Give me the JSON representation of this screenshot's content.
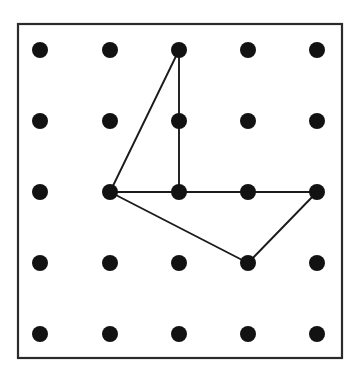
{
  "figure": {
    "background_color": "#ffffff",
    "frame": {
      "x": 18,
      "y": 24,
      "width": 324,
      "height": 334,
      "stroke_color": "#2b2b2b",
      "stroke_width": 2.2,
      "fill_color": "#ffffff"
    },
    "grid": {
      "rows": 5,
      "columns": 5,
      "column_x": [
        40,
        110,
        179,
        248,
        317
      ],
      "row_y": [
        50,
        121,
        192,
        263,
        334
      ],
      "peg_radius": 8,
      "peg_color": "#121212"
    },
    "band": {
      "stroke_color": "#1b1b1b",
      "stroke_width": 1.9,
      "edges": [
        {
          "from": [
            2,
            0
          ],
          "to": [
            1,
            2
          ]
        },
        {
          "from": [
            2,
            0
          ],
          "to": [
            2,
            2
          ]
        },
        {
          "from": [
            1,
            2
          ],
          "to": [
            2,
            2
          ]
        },
        {
          "from": [
            2,
            2
          ],
          "to": [
            3,
            2
          ]
        },
        {
          "from": [
            3,
            2
          ],
          "to": [
            4,
            2
          ]
        },
        {
          "from": [
            1,
            2
          ],
          "to": [
            3,
            3
          ]
        },
        {
          "from": [
            3,
            3
          ],
          "to": [
            4,
            2
          ]
        }
      ],
      "vertices": [
        {
          "col": 2,
          "row": 0,
          "label": "top-apex"
        },
        {
          "col": 1,
          "row": 2,
          "label": "left-hub"
        },
        {
          "col": 2,
          "row": 2,
          "label": "center"
        },
        {
          "col": 3,
          "row": 2,
          "label": "mid-right"
        },
        {
          "col": 4,
          "row": 2,
          "label": "right-corner"
        },
        {
          "col": 3,
          "row": 3,
          "label": "bottom-apex"
        }
      ]
    },
    "pegs": [
      {
        "col": 0,
        "row": 0
      },
      {
        "col": 1,
        "row": 0
      },
      {
        "col": 2,
        "row": 0
      },
      {
        "col": 3,
        "row": 0
      },
      {
        "col": 4,
        "row": 0
      },
      {
        "col": 0,
        "row": 1
      },
      {
        "col": 1,
        "row": 1
      },
      {
        "col": 2,
        "row": 1
      },
      {
        "col": 3,
        "row": 1
      },
      {
        "col": 4,
        "row": 1
      },
      {
        "col": 0,
        "row": 2
      },
      {
        "col": 1,
        "row": 2
      },
      {
        "col": 2,
        "row": 2
      },
      {
        "col": 3,
        "row": 2
      },
      {
        "col": 4,
        "row": 2
      },
      {
        "col": 0,
        "row": 3
      },
      {
        "col": 1,
        "row": 3
      },
      {
        "col": 2,
        "row": 3
      },
      {
        "col": 3,
        "row": 3
      },
      {
        "col": 4,
        "row": 3
      },
      {
        "col": 0,
        "row": 4
      },
      {
        "col": 1,
        "row": 4
      },
      {
        "col": 2,
        "row": 4
      },
      {
        "col": 3,
        "row": 4
      },
      {
        "col": 4,
        "row": 4
      }
    ]
  }
}
